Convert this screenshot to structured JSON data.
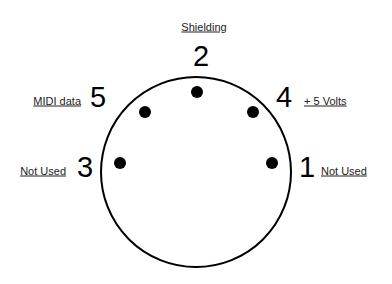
{
  "colors": {
    "stroke": "#000000",
    "pin": "#000000",
    "background": "#ffffff"
  },
  "pins": [
    {
      "number": "1",
      "label": "Not Used"
    },
    {
      "number": "2",
      "label": "Shielding"
    },
    {
      "number": "3",
      "label": "Not Used"
    },
    {
      "number": "4",
      "label": "+ 5 Volts"
    },
    {
      "number": "5",
      "label": "MIDI data"
    }
  ]
}
